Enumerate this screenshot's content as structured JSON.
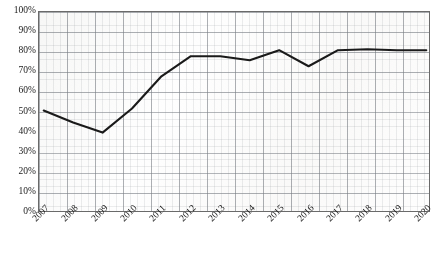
{
  "chart_data": {
    "type": "line",
    "title": "",
    "subtitle": "",
    "xlabel": "",
    "ylabel": "",
    "categories": [
      "2007",
      "2008",
      "2009",
      "2010",
      "2011",
      "2012",
      "2013",
      "2014",
      "2015",
      "2016",
      "2017",
      "2018",
      "2019",
      "2020"
    ],
    "series": [
      {
        "name": "",
        "values": [
          51,
          45,
          40,
          52,
          68,
          78,
          78,
          76,
          81,
          73,
          81,
          81.5,
          81,
          81
        ]
      }
    ],
    "ylim": [
      0,
      100
    ],
    "ytick_values": [
      0,
      10,
      20,
      30,
      40,
      50,
      60,
      70,
      80,
      90,
      100
    ],
    "ytick_labels": [
      "0%",
      "10%",
      "20%",
      "30%",
      "40%",
      "50%",
      "60%",
      "70%",
      "80%",
      "90%",
      "100%"
    ],
    "grid": true,
    "legend": "none",
    "line_color": "#1a1a1a",
    "grid_color": "#787d84",
    "background_color": "#ffffff",
    "annotations": []
  }
}
